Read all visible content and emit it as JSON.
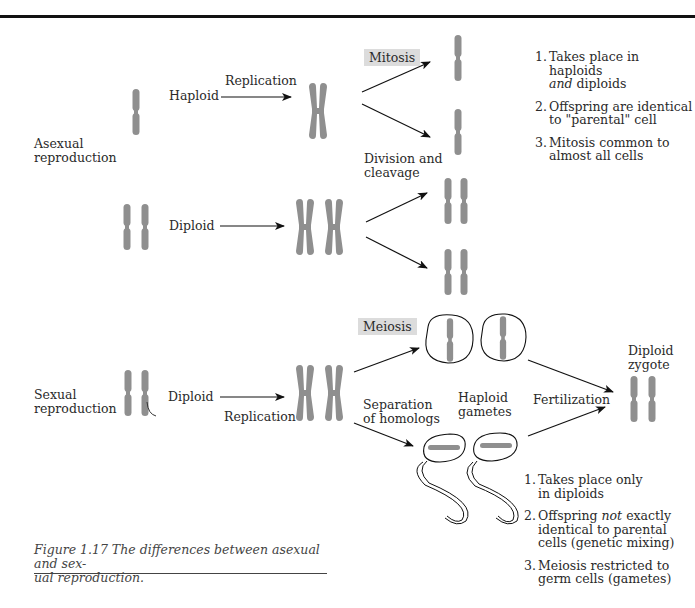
{
  "figure": {
    "number": "Figure 1.17",
    "caption": "Figure 1.17  The differences between asexual and sexual reproduction.",
    "caption_line1": "Figure 1.17  The differences between asexual and sex-",
    "caption_line2": "ual reproduction."
  },
  "asexual": {
    "section_label_1": "Asexual",
    "section_label_2": "reproduction",
    "haploid_label": "Haploid",
    "diploid_label": "Diploid",
    "replication_label": "Replication",
    "process_tag": "Mitosis",
    "division_label_1": "Division and",
    "division_label_2": "cleavage",
    "notes": [
      {
        "num": "1.",
        "line1_pre": "Takes place in haploids",
        "line2_em": "and",
        "line2_post": " diploids"
      },
      {
        "num": "2.",
        "line1": "Offspring are identical",
        "line2": "to \"parental\" cell"
      },
      {
        "num": "3.",
        "line1": "Mitosis common to",
        "line2": "almost all cells"
      }
    ]
  },
  "sexual": {
    "section_label_1": "Sexual",
    "section_label_2": "reproduction",
    "diploid_label": "Diploid",
    "replication_label": "Replication",
    "process_tag": "Meiosis",
    "separation_label_1": "Separation",
    "separation_label_2": "of homologs",
    "gametes_label_1": "Haploid",
    "gametes_label_2": "gametes",
    "fertilization_label": "Fertilization",
    "zygote_label_1": "Diploid",
    "zygote_label_2": "zygote",
    "notes": [
      {
        "num": "1.",
        "line1": "Takes place only",
        "line2": "in diploids"
      },
      {
        "num": "2.",
        "line1_pre": "Offspring ",
        "line1_em": "not",
        "line1_post": " exactly",
        "line2": "identical to parental",
        "line3": "cells (genetic mixing)"
      },
      {
        "num": "3.",
        "line1": "Meiosis restricted to",
        "line2": "germ cells (gametes)"
      }
    ]
  },
  "colors": {
    "chromosome": "#8f8f8f",
    "tag_bg": "#dcdcdc",
    "ink": "#111111"
  }
}
